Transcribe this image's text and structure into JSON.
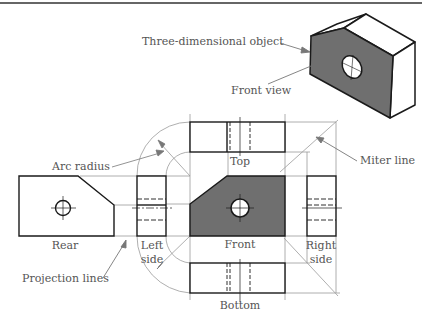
{
  "figure": {
    "colors": {
      "outline": "#1a1a1a",
      "face_fill": "#6f6f6f",
      "construction": "#9a9a9a",
      "label_text": "#555555",
      "leader": "#777777",
      "rule": "#333333"
    },
    "labels": {
      "three_d_object": "Three-dimensional object",
      "front_view": "Front view",
      "arc_radius": "Arc radius",
      "miter_line": "Miter line",
      "top": "Top",
      "rear": "Rear",
      "left_side_1": "Left",
      "left_side_2": "side",
      "front": "Front",
      "right_side_1": "Right",
      "right_side_2": "side",
      "projection_lines": "Projection lines",
      "bottom": "Bottom"
    },
    "views": [
      "Top",
      "Rear",
      "Left side",
      "Front",
      "Right side",
      "Bottom"
    ]
  }
}
